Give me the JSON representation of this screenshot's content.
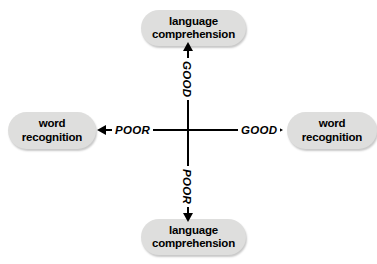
{
  "diagram": {
    "colors": {
      "node_fill": "#dededd",
      "axis": "#000000",
      "text": "#000000",
      "background": "#ffffff"
    },
    "nodes": {
      "top": {
        "line1": "language",
        "line2": "comprehension"
      },
      "bottom": {
        "line1": "language",
        "line2": "comprehension"
      },
      "left": {
        "line1": "word",
        "line2": "recognition"
      },
      "right": {
        "line1": "word",
        "line2": "recognition"
      }
    },
    "axis_labels": {
      "vertical_top": "GOOD",
      "vertical_bottom": "POOR",
      "horizontal_left": "POOR",
      "horizontal_right": "GOOD"
    },
    "arrows": {
      "up": "arrow-up-icon",
      "down": "arrow-down-icon",
      "left": "arrow-left-icon",
      "right": "arrow-right-icon"
    }
  }
}
